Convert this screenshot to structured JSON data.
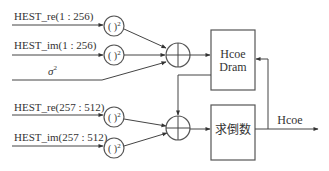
{
  "diagram": {
    "inputs": {
      "re_low": "HEST_re(1 : 256)",
      "im_low": "HEST_im(1 : 256)",
      "sigma": "σ",
      "sigma_sup": "2",
      "re_high": "HEST_re(257 : 512)",
      "im_high": "HEST_im(257 : 512)"
    },
    "square_op": "( )",
    "square_sup": "2",
    "blocks": {
      "dram_line1": "Hcoe",
      "dram_line2": "Dram",
      "reciprocal": "求倒数"
    },
    "output_label": "Hcoe",
    "colors": {
      "line": "#444444",
      "text": "#333333",
      "background": "#ffffff"
    }
  }
}
